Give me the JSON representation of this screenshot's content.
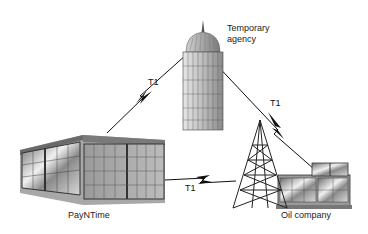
{
  "diagram": {
    "nodes": [
      {
        "id": "temporary_agency",
        "label_line1": "Temporary",
        "label_line2": "agency",
        "icon": "tower-building-icon"
      },
      {
        "id": "paynTime",
        "label": "PayNTime",
        "icon": "office-building-icon"
      },
      {
        "id": "oil_company",
        "label": "Oil company",
        "icon": "oil-derrick-factory-icon"
      }
    ],
    "links": [
      {
        "from": "paynTime",
        "to": "temporary_agency",
        "label": "T1"
      },
      {
        "from": "temporary_agency",
        "to": "oil_company",
        "label": "T1"
      },
      {
        "from": "paynTime",
        "to": "oil_company",
        "label": "T1"
      }
    ]
  }
}
